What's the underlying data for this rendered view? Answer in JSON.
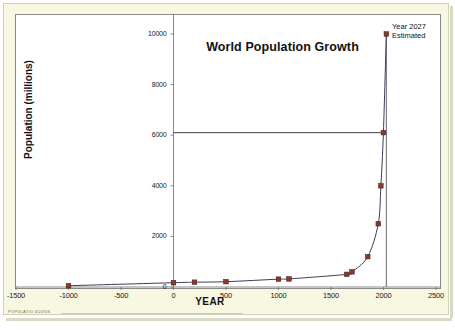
{
  "figure": {
    "background_color": "#ffffff",
    "mount_color": "#f7f7e2",
    "plot_background": "#ffffff",
    "footer_note": "POPULATIO  4/24/06"
  },
  "annotation": {
    "line1": "Year 2027",
    "line2": "Estimated"
  },
  "colors": {
    "marker": "#8b3a2a",
    "line": "#3b3b55",
    "axis": "#6d6d6d",
    "text": "#111111"
  },
  "chart_data": {
    "type": "line",
    "title": "World Population Growth",
    "xlabel": "YEAR",
    "ylabel": "Population (millions)",
    "xlim": [
      -1500,
      2500
    ],
    "ylim": [
      0,
      10000
    ],
    "xticks": [
      -1500,
      -1000,
      -500,
      0,
      500,
      1000,
      1500,
      2000,
      2500
    ],
    "xtick_labels": [
      "-1500",
      "-1000",
      "-500",
      "0",
      "500",
      "1000",
      "1500",
      "2000",
      "2500"
    ],
    "yticks": [
      0,
      2000,
      4000,
      6000,
      8000,
      10000
    ],
    "ytick_labels": [
      "0",
      "2000",
      "4000",
      "6000",
      "8000",
      "10000"
    ],
    "grid": false,
    "legend": "none",
    "series": [
      {
        "name": "World population",
        "marker": "square",
        "x": [
          -1000,
          0,
          200,
          500,
          1000,
          1100,
          1650,
          1700,
          1850,
          1950,
          1975,
          1999,
          2027
        ],
        "y": [
          50,
          170,
          190,
          210,
          310,
          320,
          500,
          600,
          1200,
          2500,
          4000,
          6100,
          10000
        ]
      }
    ],
    "reference_lines": [
      {
        "name": "present-population-line",
        "orientation": "horizontal",
        "y": 6100,
        "x_from": 0,
        "x_to": 2027
      },
      {
        "name": "estimate-vertical-line",
        "orientation": "vertical",
        "x": 2027,
        "y_from": 0,
        "y_to": 10000
      }
    ],
    "annotations": [
      {
        "text": "Year 2027 Estimated",
        "x": 2027,
        "y": 10000
      }
    ]
  }
}
